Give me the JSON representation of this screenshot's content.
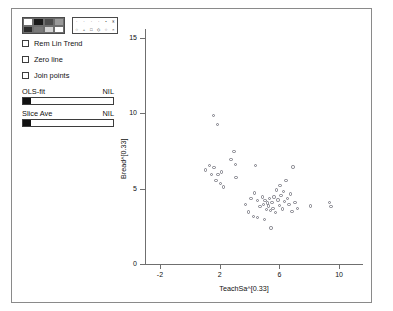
{
  "window": {
    "title": ""
  },
  "panel": {
    "color_palette": {
      "name": "color-palette",
      "swatches": [
        "#ffffff",
        "#1a1a1a",
        "#4d4d4d",
        "#9a9a9a",
        "#2b2b2b",
        "#7a7a7a",
        "#d4d4d4",
        "#ffffff"
      ]
    },
    "symbol_palette": {
      "name": "symbol-palette",
      "symbols_row1": [
        "·",
        "·",
        "·",
        "·",
        "•",
        "✳"
      ],
      "symbols_row2": [
        "○",
        "+",
        "□",
        "◇",
        "○",
        "×"
      ]
    },
    "checkboxes": [
      {
        "label": "Rem Lin Trend",
        "checked": false
      },
      {
        "label": "Zero line",
        "checked": false
      },
      {
        "label": "Join points",
        "checked": false
      }
    ],
    "sliders": [
      {
        "label": "OLS-fit",
        "value_label": "NIL",
        "fill_percent": 8
      },
      {
        "label": "Slice Ave",
        "value_label": "NIL",
        "fill_percent": 8
      }
    ]
  },
  "chart_data": {
    "type": "scatter",
    "title": "",
    "xlabel": "TeachSa^[0.33]",
    "ylabel": "Bread^[0.33]",
    "xlim": [
      -3.0,
      11.6
    ],
    "ylim": [
      0,
      15.6
    ],
    "xticks": [
      -2,
      2,
      6,
      10
    ],
    "yticks": [
      0,
      5,
      10,
      15
    ],
    "grid": false,
    "legend": "none",
    "marker": "open-circle",
    "marker_color": "#7b7b84",
    "points": [
      [
        1.05,
        6.25
      ],
      [
        1.3,
        6.55
      ],
      [
        1.45,
        5.95
      ],
      [
        1.62,
        6.4
      ],
      [
        1.75,
        5.55
      ],
      [
        1.9,
        5.95
      ],
      [
        2.05,
        5.35
      ],
      [
        2.12,
        6.1
      ],
      [
        2.25,
        5.1
      ],
      [
        1.58,
        9.85
      ],
      [
        1.85,
        9.25
      ],
      [
        2.95,
        7.45
      ],
      [
        3.05,
        6.6
      ],
      [
        3.1,
        5.75
      ],
      [
        2.75,
        6.95
      ],
      [
        4.4,
        6.55
      ],
      [
        4.1,
        4.35
      ],
      [
        4.35,
        4.7
      ],
      [
        4.55,
        4.2
      ],
      [
        4.7,
        3.8
      ],
      [
        4.85,
        4.45
      ],
      [
        4.95,
        3.95
      ],
      [
        5.05,
        4.2
      ],
      [
        5.12,
        3.6
      ],
      [
        5.2,
        4.05
      ],
      [
        5.28,
        3.85
      ],
      [
        5.35,
        4.35
      ],
      [
        5.42,
        3.55
      ],
      [
        5.5,
        4.1
      ],
      [
        5.58,
        3.7
      ],
      [
        5.65,
        4.45
      ],
      [
        5.72,
        3.4
      ],
      [
        5.8,
        4.9
      ],
      [
        5.9,
        4.25
      ],
      [
        6.0,
        3.9
      ],
      [
        6.05,
        5.2
      ],
      [
        6.12,
        4.55
      ],
      [
        6.2,
        3.65
      ],
      [
        6.28,
        4.8
      ],
      [
        6.35,
        4.15
      ],
      [
        6.45,
        5.55
      ],
      [
        6.55,
        4.35
      ],
      [
        6.65,
        3.95
      ],
      [
        6.75,
        4.65
      ],
      [
        6.85,
        3.5
      ],
      [
        7.05,
        4.1
      ],
      [
        7.2,
        3.7
      ],
      [
        3.75,
        3.95
      ],
      [
        3.95,
        3.45
      ],
      [
        4.25,
        3.15
      ],
      [
        5.45,
        2.4
      ],
      [
        5.0,
        2.95
      ],
      [
        4.55,
        3.1
      ],
      [
        8.1,
        3.85
      ],
      [
        9.35,
        4.1
      ],
      [
        9.45,
        3.8
      ],
      [
        6.9,
        6.45
      ]
    ]
  }
}
